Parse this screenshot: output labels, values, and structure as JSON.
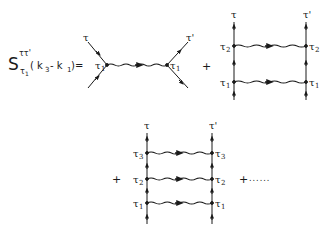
{
  "equation": {
    "symbol": "S",
    "superscript": "ττ'",
    "subscript": "τ",
    "subscript_index": "1",
    "argument": "( k",
    "argument_k3_index": "3",
    "argument_minus": " - k",
    "argument_k1_index": "1",
    "argument_close": ")=",
    "full_text": "S^{ττ'}_{τ1}(k3 - k1) ="
  },
  "operators": {
    "plus": "+",
    "ellipsis": "......"
  },
  "diagram1": {
    "type": "single-exchange",
    "left_top_label": "τ",
    "right_top_label": "τ'",
    "left_vertex_label": "τ",
    "left_vertex_index": "1",
    "right_vertex_label": "τ",
    "right_vertex_index": "1"
  },
  "diagram2": {
    "type": "ladder-2-rungs",
    "left_top_label": "τ",
    "right_top_label": "τ'",
    "rungs": [
      {
        "label": "τ",
        "index": "2"
      },
      {
        "label": "τ",
        "index": "1"
      }
    ]
  },
  "diagram3": {
    "type": "ladder-3-rungs",
    "left_top_label": "τ",
    "right_top_label": "τ'",
    "rungs": [
      {
        "label": "τ",
        "index": "3"
      },
      {
        "label": "τ",
        "index": "2"
      },
      {
        "label": "τ",
        "index": "1"
      }
    ]
  },
  "colors": {
    "ink": "#1a1a1a",
    "background": "#ffffff"
  }
}
